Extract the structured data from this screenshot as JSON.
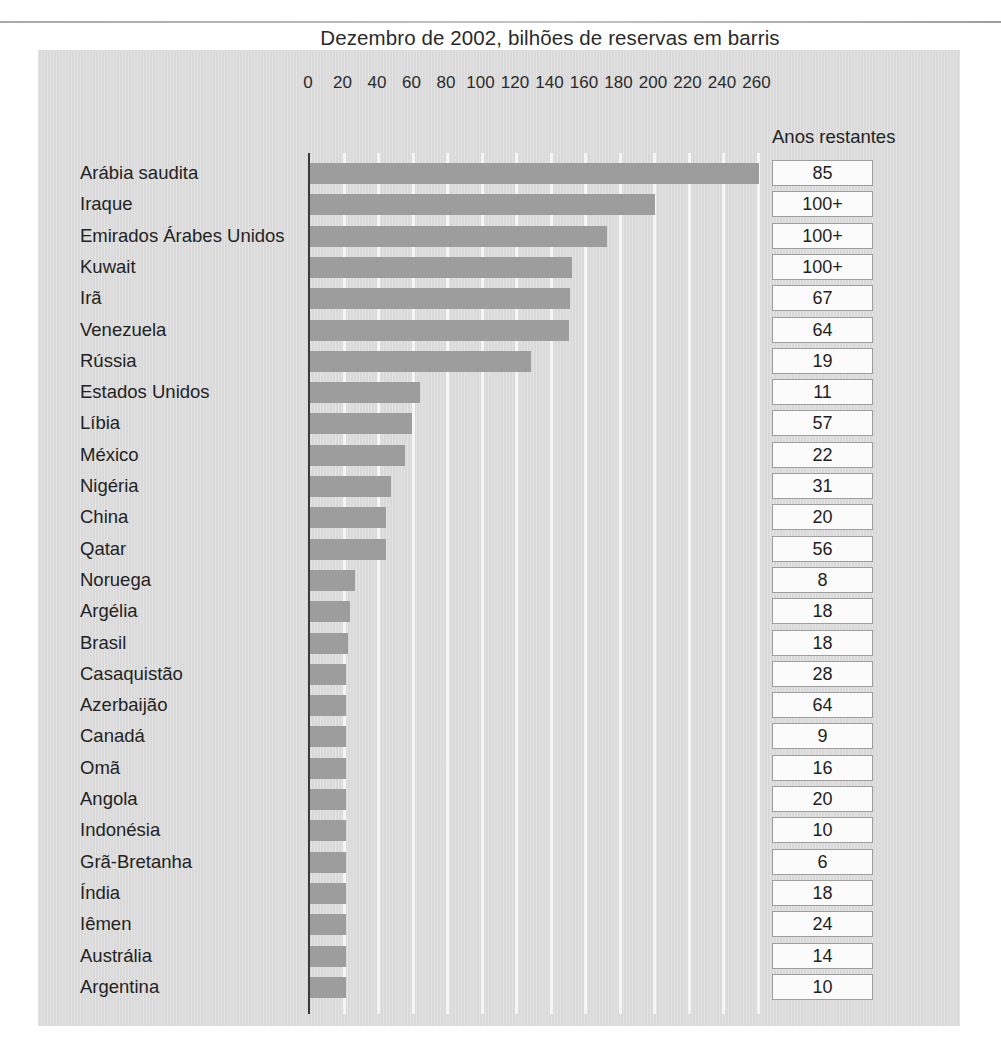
{
  "figure": {
    "title": "Dezembro de 2002, bilhões de reservas em barris",
    "years_column_header": "Anos restantes",
    "panel_color": "#dcdcdc",
    "bar_color": "#9d9d9d",
    "gridline_color": "#f7f7f7",
    "axis_color": "#3a3a3a",
    "value_box_border_color": "#9e9e9e",
    "value_box_fill": "#fbfbfb"
  },
  "chart_data": {
    "type": "bar",
    "orientation": "horizontal",
    "title": "Dezembro de 2002, bilhões de reservas em barris",
    "xlabel": "",
    "ylabel": "",
    "xlim": [
      0,
      270
    ],
    "xticks": [
      0,
      20,
      40,
      60,
      80,
      100,
      120,
      140,
      160,
      180,
      200,
      220,
      240,
      260
    ],
    "grid": true,
    "legend": null,
    "categories": [
      "Arábia saudita",
      "Iraque",
      "Emirados Árabes Unidos",
      "Kuwait",
      "Irã",
      "Venezuela",
      "Rússia",
      "Estados Unidos",
      "Líbia",
      "México",
      "Nigéria",
      "China",
      "Qatar",
      "Noruega",
      "Argélia",
      "Brasil",
      "Casaquistão",
      "Azerbaijão",
      "Canadá",
      "Omã",
      "Angola",
      "Indonésia",
      "Grã-Bretanha",
      "Índia",
      "Iêmen",
      "Austrália",
      "Argentina"
    ],
    "values": [
      260,
      200,
      172,
      152,
      151,
      150,
      128,
      64,
      59,
      55,
      47,
      44,
      44,
      26,
      23,
      22,
      21,
      21,
      21,
      21,
      21,
      21,
      21,
      21,
      21,
      21,
      21
    ],
    "secondary_series": {
      "name": "Anos restantes",
      "values": [
        "85",
        "100+",
        "100+",
        "100+",
        "67",
        "64",
        "19",
        "11",
        "57",
        "22",
        "31",
        "20",
        "56",
        "8",
        "18",
        "18",
        "28",
        "64",
        "9",
        "16",
        "20",
        "10",
        "6",
        "18",
        "24",
        "14",
        "10"
      ]
    }
  }
}
